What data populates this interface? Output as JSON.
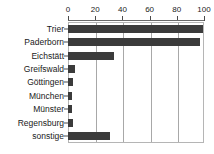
{
  "chart_data": {
    "type": "bar",
    "orientation": "horizontal",
    "title": "",
    "xlabel": "",
    "ylabel": "",
    "xlim": [
      0,
      100
    ],
    "grid": true,
    "legend": null,
    "bar_color": "#3b3b3b",
    "axis_color": "#a8a8a8",
    "xticks": [
      {
        "value": 0,
        "label": "0"
      },
      {
        "value": 20,
        "label": "20"
      },
      {
        "value": 40,
        "label": "40"
      },
      {
        "value": 60,
        "label": "60"
      },
      {
        "value": 80,
        "label": "80"
      },
      {
        "value": 100,
        "label": "100"
      }
    ],
    "categories": [
      "Trier",
      "Paderborn",
      "Eichstätt",
      "Greifswald",
      "Göttingen",
      "München",
      "Münster",
      "Regensburg",
      "sonstige"
    ],
    "values": [
      99,
      97,
      34,
      5,
      4,
      3,
      3,
      4,
      31
    ]
  }
}
